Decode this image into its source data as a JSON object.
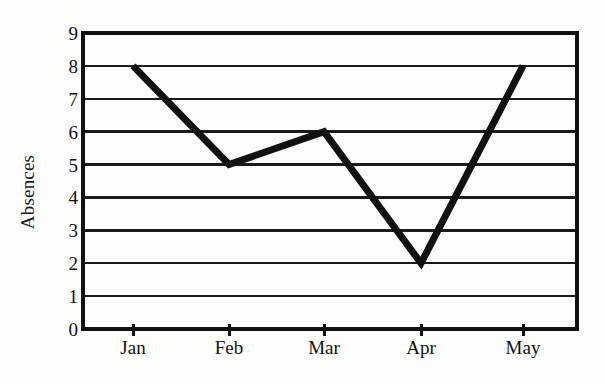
{
  "chart_data": {
    "type": "line",
    "title": "",
    "xlabel": "",
    "ylabel": "Absences",
    "categories": [
      "Jan",
      "Feb",
      "Mar",
      "Apr",
      "May"
    ],
    "values": [
      8,
      5,
      6,
      2,
      8
    ],
    "series": [
      {
        "name": "Absences",
        "values": [
          8,
          5,
          6,
          2,
          8
        ]
      }
    ],
    "ylim": [
      0,
      9
    ],
    "y_ticks": [
      0,
      1,
      2,
      3,
      4,
      5,
      6,
      7,
      8,
      9
    ],
    "y_tick_labels": [
      "0",
      "1",
      "2",
      "3",
      "4",
      "5",
      "6",
      "7",
      "8",
      "9"
    ],
    "x_tick_labels": [
      "Jan",
      "Feb",
      "Mar",
      "Apr",
      "May"
    ],
    "grid": "horizontal",
    "legend": "none",
    "annotations": []
  },
  "style": {
    "line_color": "#111111",
    "grid_color": "#1a1a1a",
    "axis_color": "#111111",
    "background_color": "#fdfdfc",
    "text_color": "#111111",
    "line_width": 7
  },
  "axis": {
    "y_title": "Absences"
  }
}
